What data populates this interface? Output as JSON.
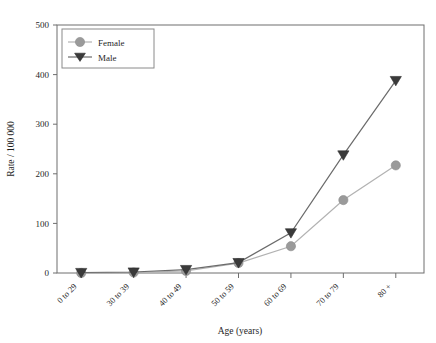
{
  "chart_data": {
    "type": "line",
    "title": "",
    "xlabel": "Age (years)",
    "ylabel": "Rate / 100 000",
    "categories": [
      "0 to 29",
      "30 to 39",
      "40 to 49",
      "50 to 59",
      "60 to 69",
      "70 to 79",
      "80 +"
    ],
    "series": [
      {
        "name": "Female",
        "marker": "circle",
        "color": "#9a9a9a",
        "line_color": "#b2b2b2",
        "values": [
          0,
          1,
          4,
          20,
          54,
          147,
          217
        ]
      },
      {
        "name": "Male",
        "marker": "triangle-down",
        "color": "#3a3a3a",
        "line_color": "#6b6b6b",
        "values": [
          1,
          2,
          7,
          21,
          81,
          238,
          388
        ]
      }
    ],
    "ylim": [
      0,
      500
    ],
    "yticks": [
      0,
      100,
      200,
      300,
      400,
      500
    ],
    "ytick_labels": [
      "0",
      "100",
      "200",
      "300",
      "400",
      "500"
    ],
    "grid": false,
    "legend_position": "top-left",
    "legend_entries": [
      "Female",
      "Male"
    ]
  }
}
